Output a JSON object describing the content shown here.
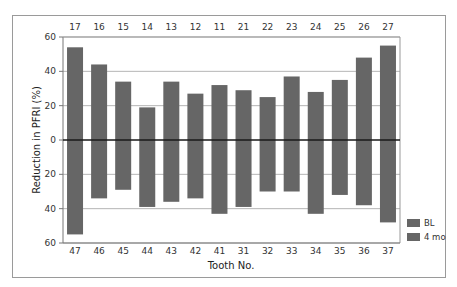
{
  "chart_data": {
    "type": "bar",
    "title": "",
    "xlabel": "Tooth No.",
    "ylabel": "Reduction in PFRI (%)",
    "ylim": [
      -60,
      60
    ],
    "yticks": [
      60,
      40,
      20,
      0,
      20,
      40,
      60
    ],
    "grid": true,
    "legend_position": "right-bottom",
    "legend": [
      "BL",
      "4 mo"
    ],
    "categories_top": [
      "17",
      "16",
      "15",
      "14",
      "13",
      "12",
      "11",
      "21",
      "22",
      "23",
      "24",
      "25",
      "26",
      "27"
    ],
    "categories_bottom": [
      "47",
      "46",
      "45",
      "44",
      "43",
      "42",
      "41",
      "31",
      "32",
      "33",
      "34",
      "35",
      "36",
      "37"
    ],
    "series": [
      {
        "name": "Maxillary (upper teeth)",
        "values": [
          54,
          44,
          34,
          19,
          34,
          27,
          32,
          29,
          25,
          37,
          28,
          35,
          48,
          55
        ]
      },
      {
        "name": "Mandibular (lower teeth)",
        "values": [
          55,
          34,
          29,
          39,
          36,
          34,
          43,
          39,
          30,
          30,
          43,
          32,
          38,
          48
        ]
      }
    ],
    "colors": {
      "bar": "#666666",
      "grid": "#b5b5b5",
      "zero_line": "#1a1a1a",
      "frame": "#9a9a9a"
    }
  }
}
